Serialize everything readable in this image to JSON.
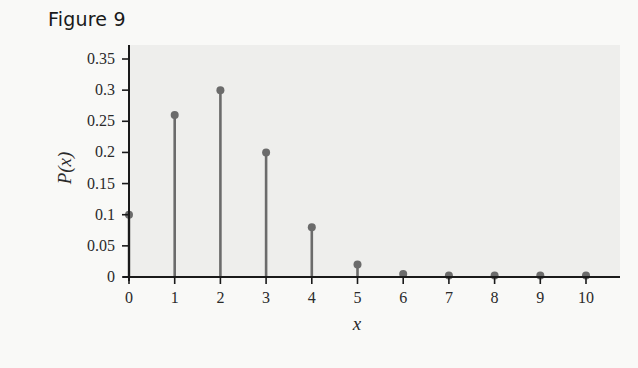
{
  "figure": {
    "title": "Figure 9"
  },
  "chart_data": {
    "type": "bar",
    "subtype": "stem",
    "title": "Figure 9",
    "xlabel": "x",
    "ylabel": "P(x)",
    "categories": [
      0,
      1,
      2,
      3,
      4,
      5,
      6,
      7,
      8,
      9,
      10
    ],
    "values": [
      0.1,
      0.26,
      0.3,
      0.2,
      0.08,
      0.02,
      0.005,
      0.001,
      0.0,
      0.0,
      0.0
    ],
    "xticks": [
      "0",
      "1",
      "2",
      "3",
      "4",
      "5",
      "6",
      "7",
      "8",
      "9",
      "10"
    ],
    "yticks": [
      "0",
      "0.05",
      "0.1",
      "0.15",
      "0.2",
      "0.25",
      "0.3",
      "0.35"
    ],
    "ylim": [
      0,
      0.35
    ],
    "xlim": [
      0,
      10
    ],
    "grid": false,
    "legend": null,
    "colors": {
      "stem": "#6b6b6b",
      "axis": "#1a1a1a",
      "plot_bg": "#eeeeec",
      "page_bg": "#f9f9f7"
    }
  }
}
